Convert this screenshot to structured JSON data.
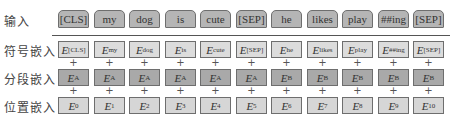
{
  "rows": {
    "input": {
      "label": "输入"
    },
    "token": {
      "label": "符号嵌入"
    },
    "segment": {
      "label": "分段嵌入"
    },
    "position": {
      "label": "位置嵌入"
    }
  },
  "plus_symbol": "+",
  "embedding_symbol": "E",
  "columns": [
    {
      "input": "[CLS]",
      "token_sub": "[CLS]",
      "segment_sub": "A",
      "position_sub": "0"
    },
    {
      "input": "my",
      "token_sub": "my",
      "segment_sub": "A",
      "position_sub": "1"
    },
    {
      "input": "dog",
      "token_sub": "dog",
      "segment_sub": "A",
      "position_sub": "2"
    },
    {
      "input": "is",
      "token_sub": "is",
      "segment_sub": "A",
      "position_sub": "3"
    },
    {
      "input": "cute",
      "token_sub": "cute",
      "segment_sub": "A",
      "position_sub": "4"
    },
    {
      "input": "[SEP]",
      "token_sub": "[SEP]",
      "segment_sub": "A",
      "position_sub": "5"
    },
    {
      "input": "he",
      "token_sub": "he",
      "segment_sub": "B",
      "position_sub": "6"
    },
    {
      "input": "likes",
      "token_sub": "likes",
      "segment_sub": "B",
      "position_sub": "7"
    },
    {
      "input": "play",
      "token_sub": "play",
      "segment_sub": "B",
      "position_sub": "8"
    },
    {
      "input": "##ing",
      "token_sub": "##ing",
      "segment_sub": "B",
      "position_sub": "9"
    },
    {
      "input": "[SEP]",
      "token_sub": "[SEP]",
      "segment_sub": "B",
      "position_sub": "10"
    }
  ],
  "colors": {
    "input_fill": "#b5b5b5",
    "token_fill": "#dcdcdc",
    "segment_fill": "#a9a9a9",
    "position_fill": "#d6d6d6",
    "border": "#6e6e6e"
  }
}
